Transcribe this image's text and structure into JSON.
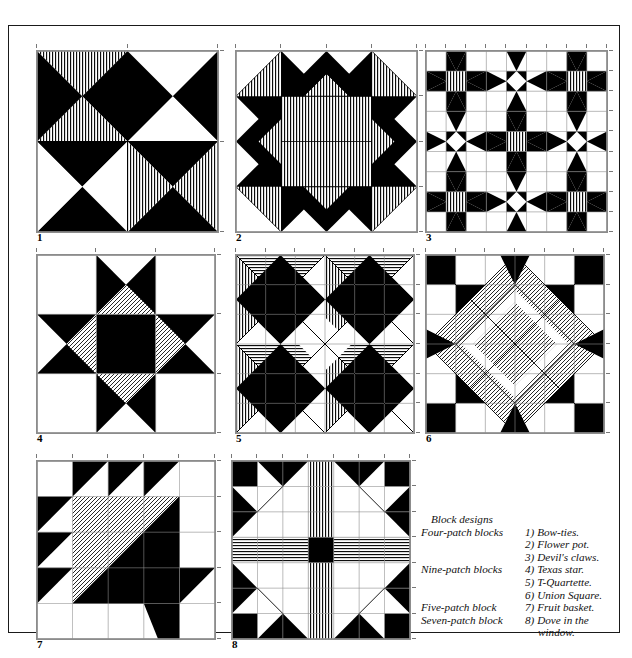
{
  "page": {
    "background": "#ffffff",
    "frame_color": "#1a1a1a"
  },
  "colors": {
    "ink": "#000000",
    "paper": "#ffffff",
    "rule": "#8c8c8c",
    "hatch": "#111111"
  },
  "caption": {
    "heading": "Block designs",
    "rows": [
      {
        "group": "Four-patch blocks",
        "number": "1)",
        "name": "Bow-ties."
      },
      {
        "group": "",
        "number": "2)",
        "name": "Flower pot."
      },
      {
        "group": "",
        "number": "3)",
        "name": "Devil's claws."
      },
      {
        "group": "Nine-patch blocks",
        "number": "4)",
        "name": "Texas star."
      },
      {
        "group": "",
        "number": "5)",
        "name": "T-Quartette."
      },
      {
        "group": "",
        "number": "6)",
        "name": "Union Square."
      },
      {
        "group": "Five-patch block",
        "number": "7)",
        "name": "Fruit basket."
      },
      {
        "group": "Seven-patch block",
        "number": "8)",
        "name": "Dove in the"
      },
      {
        "group": "",
        "number": "",
        "name": "window."
      }
    ]
  },
  "blocks": [
    {
      "number": "1",
      "name": "Bow-ties.",
      "category": "Four-patch blocks",
      "grid": 2,
      "hatch": "vertical",
      "x": 27,
      "y": 24,
      "size": 181,
      "units": [
        {
          "type": "hourglass",
          "r": 0,
          "c": 0,
          "top": "hatch",
          "right": "black",
          "bottom": "hatch",
          "left": "black"
        },
        {
          "type": "hourglass",
          "r": 0,
          "c": 1,
          "top": "white",
          "right": "black",
          "bottom": "white",
          "left": "black"
        },
        {
          "type": "hourglass",
          "r": 1,
          "c": 0,
          "top": "black",
          "right": "white",
          "bottom": "black",
          "left": "white"
        },
        {
          "type": "hourglass",
          "r": 1,
          "c": 1,
          "top": "black",
          "right": "hatch",
          "bottom": "black",
          "left": "hatch"
        }
      ]
    },
    {
      "number": "2",
      "name": "Flower pot.",
      "category": "Four-patch blocks",
      "grid": 4,
      "hatch": "vertical",
      "x": 226,
      "y": 24,
      "size": 181
    },
    {
      "number": "3",
      "name": "Devil's claws.",
      "category": "Four-patch blocks",
      "grid": 9,
      "hatch": "vertical",
      "x": 416,
      "y": 24,
      "size": 181
    },
    {
      "number": "4",
      "name": "Texas star.",
      "category": "Nine-patch blocks",
      "grid": 3,
      "hatch": "diagonal",
      "x": 27,
      "y": 228,
      "size": 178
    },
    {
      "number": "5",
      "name": "T-Quartette.",
      "category": "Nine-patch blocks",
      "grid": 6,
      "hatch": "mixed",
      "x": 226,
      "y": 228,
      "size": 178
    },
    {
      "number": "6",
      "name": "Union Square.",
      "category": "Nine-patch blocks",
      "grid": 6,
      "hatch": "diagonal",
      "x": 416,
      "y": 228,
      "size": 178
    },
    {
      "number": "7",
      "name": "Fruit basket.",
      "category": "Five-patch block",
      "grid": 5,
      "hatch": "diagonal",
      "x": 27,
      "y": 434,
      "size": 178
    },
    {
      "number": "8",
      "name": "Dove in the window.",
      "category": "Seven-patch block",
      "grid": 7,
      "hatch": "mixed",
      "x": 222,
      "y": 434,
      "size": 178
    }
  ]
}
